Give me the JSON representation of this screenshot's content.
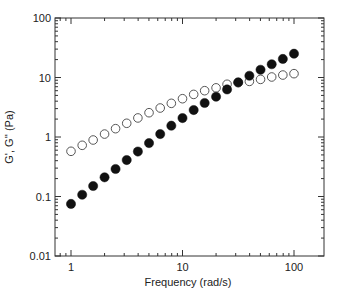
{
  "chart_data": {
    "type": "scatter",
    "title": "",
    "xlabel": "Frequency  (rad/s)",
    "ylabel": "G', G'' (Pa)",
    "xscale": "log",
    "yscale": "log",
    "xlim": [
      0.8,
      200
    ],
    "ylim": [
      0.01,
      100
    ],
    "xticks": [
      1,
      10,
      100
    ],
    "xtick_labels": [
      "1",
      "10",
      "100"
    ],
    "yticks": [
      0.01,
      0.1,
      1,
      10,
      100
    ],
    "ytick_labels": [
      "0.01",
      "0.1",
      "1",
      "10",
      "100"
    ],
    "grid": false,
    "legend": null,
    "x": [
      1,
      1.26,
      1.58,
      2,
      2.51,
      3.16,
      3.98,
      5.01,
      6.31,
      7.94,
      10,
      12.6,
      15.8,
      20,
      25.1,
      31.6,
      39.8,
      50.1,
      63.1,
      79.4,
      100
    ],
    "series": [
      {
        "name": "G'",
        "marker": "filled-circle",
        "color": "#111111",
        "values": [
          0.075,
          0.107,
          0.15,
          0.21,
          0.29,
          0.41,
          0.57,
          0.79,
          1.12,
          1.55,
          2.08,
          2.84,
          3.73,
          4.75,
          6.3,
          8.3,
          10.7,
          13.5,
          16.7,
          20.5,
          25.1
        ]
      },
      {
        "name": "G''",
        "marker": "open-circle",
        "color": "#444444",
        "values": [
          0.575,
          0.725,
          0.89,
          1.12,
          1.38,
          1.7,
          2.09,
          2.56,
          3.07,
          3.68,
          4.4,
          5.2,
          6.0,
          6.7,
          7.7,
          8.2,
          8.6,
          9.3,
          10.2,
          11.0,
          11.6
        ]
      }
    ]
  }
}
